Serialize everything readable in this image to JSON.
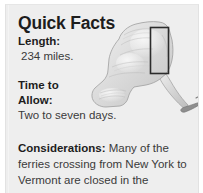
{
  "panel": {
    "title": "Quick Facts",
    "background_color": "#eeeeee",
    "text_color": "#3a3a3a",
    "heading_color": "#1d1d1d"
  },
  "facts": {
    "length": {
      "label": "Length:",
      "value": "234 miles."
    },
    "time_to_allow": {
      "label_line1": "Time to",
      "label_line2": "Allow:",
      "value": "Two to seven days."
    },
    "considerations": {
      "label": "Considerations:",
      "text": " Many of the ferries crossing from New York to Vermont are closed in the"
    }
  },
  "map": {
    "name": "new-york-state-relief-map",
    "land_color": "#d8d8d8",
    "shadow_color": "#b4b4b4",
    "highlight_color": "#f2f2f2",
    "outline_color": "#9a9a9a",
    "callout_box_color": "#2c2c2c",
    "long_island_color": "#8e8e8e"
  }
}
